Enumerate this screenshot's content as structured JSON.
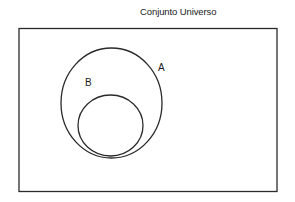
{
  "title": "Conjunto Universo",
  "universe": {
    "x": 19,
    "y": 28.5,
    "width": 258,
    "height": 163,
    "stroke": "#2a2a2a"
  },
  "sets": [
    {
      "label": "A",
      "cx": 111.5,
      "cy": 103,
      "rx": 50.5,
      "ry": 55,
      "label_x": 158,
      "label_y": 71
    },
    {
      "label": "B",
      "cx": 110.5,
      "cy": 125.5,
      "rx": 32.5,
      "ry": 30.5,
      "label_x": 85,
      "label_y": 86
    }
  ],
  "relationship": "B ⊂ A ⊂ U"
}
